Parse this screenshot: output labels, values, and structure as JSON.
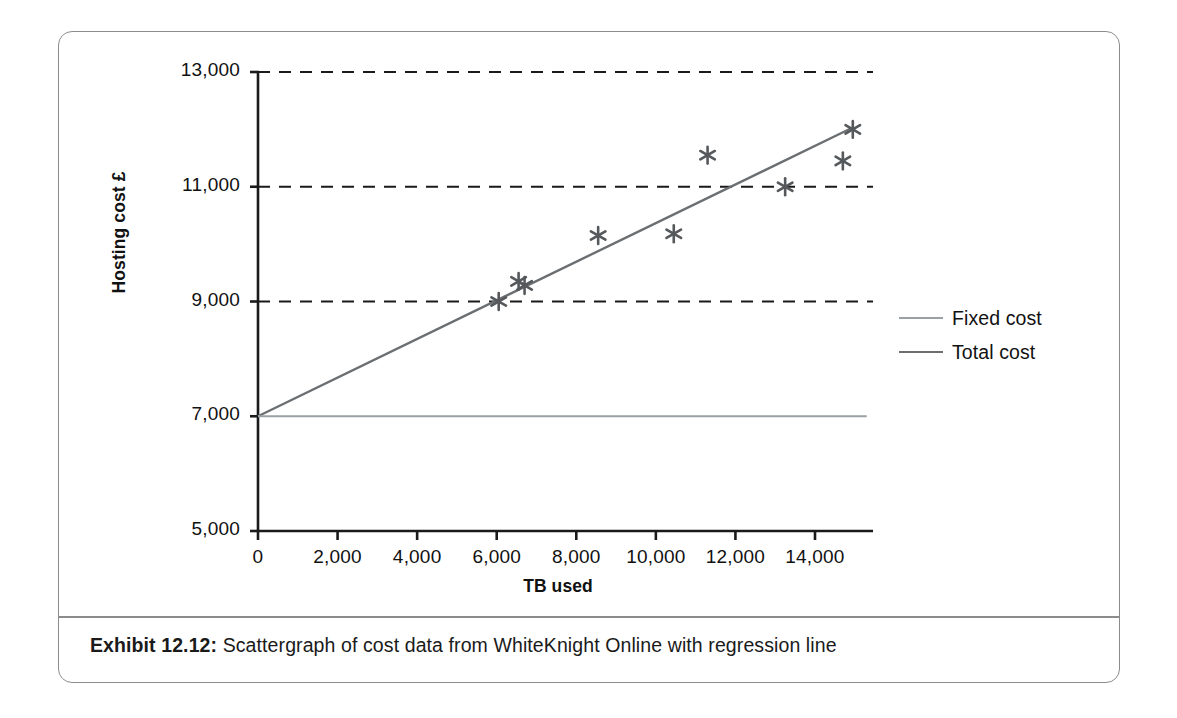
{
  "figure": {
    "caption_label": "Exhibit 12.12:",
    "caption_text": "Scattergraph of cost data from WhiteKnight Online with regression line"
  },
  "colors": {
    "frame": "#8c8c8c",
    "axis": "#1a1a1a",
    "gridline": "#1a1a1a",
    "total_cost_line": "#6b6f72",
    "fixed_cost_line": "#9aa0a3",
    "marker": "#56595c",
    "text": "#111111"
  },
  "chart_data": {
    "type": "scatter",
    "title": "",
    "xlabel": "TB used",
    "ylabel": "Hosting cost £",
    "xlim": [
      0,
      15300
    ],
    "ylim": [
      5000,
      13000
    ],
    "xticks": [
      0,
      2000,
      4000,
      6000,
      8000,
      10000,
      12000,
      14000
    ],
    "xticklabels": [
      "0",
      "2,000",
      "4,000",
      "6,000",
      "8,000",
      "10,000",
      "12,000",
      "14,000"
    ],
    "yticks": [
      5000,
      7000,
      9000,
      11000,
      13000
    ],
    "yticklabels": [
      "5,000",
      "7,000",
      "9,000",
      "11,000",
      "13,000"
    ],
    "grid": "horizontal-dashed",
    "gridlines_at": [
      9000,
      11000,
      13000
    ],
    "legend_position": "right",
    "series": [
      {
        "name": "Scatter points",
        "type": "scatter",
        "marker": "asterisk",
        "points": [
          {
            "x": 6050,
            "y": 9000
          },
          {
            "x": 6550,
            "y": 9350
          },
          {
            "x": 6700,
            "y": 9280
          },
          {
            "x": 8550,
            "y": 10150
          },
          {
            "x": 10450,
            "y": 10180
          },
          {
            "x": 11300,
            "y": 11550
          },
          {
            "x": 13250,
            "y": 11000
          },
          {
            "x": 14700,
            "y": 11450
          },
          {
            "x": 14950,
            "y": 12000
          }
        ]
      },
      {
        "name": "Total cost",
        "type": "line",
        "intercept": 7000,
        "slope": 0.3367,
        "x_start": 0,
        "x_end": 14950,
        "y_start": 7000,
        "y_end": 12033
      },
      {
        "name": "Fixed cost",
        "type": "line",
        "intercept": 7000,
        "slope": 0,
        "x_start": 0,
        "x_end": 15300,
        "y_start": 7000,
        "y_end": 7000
      }
    ],
    "legend": [
      {
        "label": "Fixed cost",
        "color": "#9aa0a3"
      },
      {
        "label": "Total cost",
        "color": "#6b6f72"
      }
    ]
  }
}
